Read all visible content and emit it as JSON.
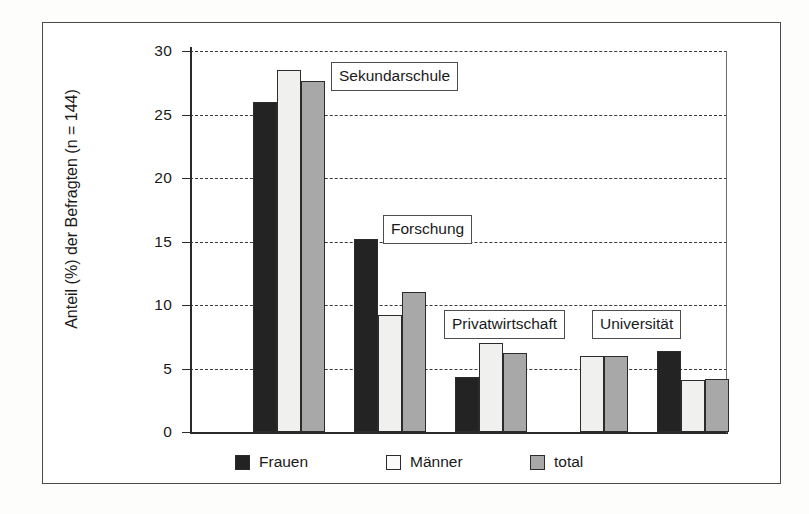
{
  "chart_data": {
    "type": "bar",
    "title": "",
    "subtitle": "",
    "xlabel": "",
    "ylabel": "Anteil (%) der Befragten (n = 144)",
    "ylim": [
      0,
      30
    ],
    "ytick_labels": [
      "30",
      "25",
      "20",
      "15",
      "10",
      "5",
      "0"
    ],
    "yticks": [
      30,
      25,
      20,
      15,
      10,
      5,
      0
    ],
    "grid": "horizontal dashed gridlines at every y tick",
    "legend_position": "bottom-center, below plot area",
    "categories": [
      "Sekundarschule",
      "Forschung",
      "Privatwirtschaft",
      "Universität",
      "Universität"
    ],
    "group_labels_boxed": [
      "Sekundarschule",
      "Forschung",
      "Privatwirtschaft",
      "Universität"
    ],
    "series": [
      {
        "name": "Frauen",
        "color": "#232323",
        "values": [
          26.0,
          15.2,
          4.3,
          0.0,
          6.4
        ]
      },
      {
        "name": "Männer",
        "color": "#f0f0ee",
        "values": [
          28.5,
          9.2,
          7.0,
          6.0,
          4.1
        ]
      },
      {
        "name": "total",
        "color": "#a8a8a8",
        "values": [
          27.6,
          11.0,
          6.2,
          6.0,
          4.2
        ]
      }
    ]
  },
  "axis": {
    "y_title": "Anteil (%) der Befragten (n = 144)",
    "ticks": [
      {
        "label": "30",
        "value": 30
      },
      {
        "label": "25",
        "value": 25
      },
      {
        "label": "20",
        "value": 20
      },
      {
        "label": "15",
        "value": 15
      },
      {
        "label": "10",
        "value": 10
      },
      {
        "label": "5",
        "value": 5
      },
      {
        "label": "0",
        "value": 0
      }
    ]
  },
  "group_labels": [
    {
      "text": "Sekundarschule",
      "left": 331,
      "top": 62
    },
    {
      "text": "Forschung",
      "left": 383,
      "top": 215
    },
    {
      "text": "Privatwirtschaft",
      "left": 444,
      "top": 310
    },
    {
      "text": "Universität",
      "left": 592,
      "top": 310
    }
  ],
  "legend": {
    "items": [
      {
        "label": "Frauen",
        "swatch": "frauen",
        "color": "#232323"
      },
      {
        "label": "Männer",
        "swatch": "maenner",
        "color": "#fafafa"
      },
      {
        "label": "total",
        "swatch": "total",
        "color": "#a8a8a8"
      }
    ]
  }
}
